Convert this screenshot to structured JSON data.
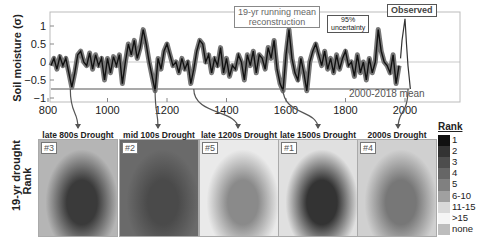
{
  "chart_data": [
    {
      "type": "line",
      "title": "",
      "xlabel": "",
      "ylabel": "Soil moisture (σ)",
      "xlim": [
        800,
        2018
      ],
      "ylim": [
        -1.1,
        1.4
      ],
      "x_ticks": [
        "800",
        "1000",
        "1200",
        "1400",
        "1600",
        "1800",
        "2000"
      ],
      "y_ticks": [
        "1",
        "0.5",
        "0",
        "-0.5",
        "-1"
      ],
      "grid": false,
      "series": [
        {
          "name": "19-yr running mean reconstruction",
          "x": [
            810,
            820,
            830,
            840,
            850,
            860,
            870,
            880,
            890,
            900,
            910,
            920,
            930,
            940,
            950,
            960,
            970,
            980,
            990,
            1000,
            1010,
            1020,
            1030,
            1040,
            1050,
            1060,
            1070,
            1080,
            1090,
            1100,
            1110,
            1120,
            1130,
            1140,
            1150,
            1160,
            1170,
            1180,
            1190,
            1200,
            1210,
            1220,
            1230,
            1240,
            1250,
            1260,
            1270,
            1280,
            1290,
            1300,
            1310,
            1320,
            1330,
            1340,
            1350,
            1360,
            1370,
            1380,
            1390,
            1400,
            1410,
            1420,
            1430,
            1440,
            1450,
            1460,
            1470,
            1480,
            1490,
            1500,
            1510,
            1520,
            1530,
            1540,
            1550,
            1560,
            1570,
            1580,
            1590,
            1600,
            1610,
            1620,
            1630,
            1640,
            1650,
            1660,
            1670,
            1680,
            1690,
            1700,
            1710,
            1720,
            1730,
            1740,
            1750,
            1760,
            1770,
            1780,
            1790,
            1800,
            1810,
            1820,
            1830,
            1840,
            1850,
            1860,
            1870,
            1880,
            1890,
            1900,
            1910,
            1920,
            1930,
            1940,
            1950,
            1960,
            1970,
            1980
          ],
          "values": [
            -0.1,
            0.1,
            -0.2,
            0.15,
            -0.1,
            0.1,
            -0.3,
            -0.7,
            -0.3,
            0.2,
            0.3,
            0.0,
            -0.1,
            0.25,
            -0.2,
            0.2,
            -0.1,
            0.1,
            -0.5,
            0.1,
            -0.3,
            0.15,
            -0.1,
            0.2,
            -0.6,
            0.0,
            0.5,
            0.2,
            0.6,
            0.1,
            0.4,
            0.9,
            0.5,
            0.0,
            -0.4,
            -0.8,
            0.1,
            -0.2,
            0.3,
            0.5,
            0.2,
            -0.1,
            0.0,
            -0.3,
            0.1,
            -0.2,
            0.0,
            -0.6,
            -0.2,
            0.3,
            0.6,
            0.5,
            0.0,
            0.2,
            -0.3,
            0.1,
            -0.1,
            0.4,
            -0.3,
            0.1,
            -0.4,
            -0.1,
            -0.2,
            0.2,
            0.0,
            -0.5,
            0.2,
            -0.1,
            0.3,
            -0.3,
            0.2,
            0.1,
            -0.2,
            0.4,
            0.1,
            0.6,
            -0.2,
            -0.6,
            -0.8,
            0.2,
            0.9,
            0.1,
            -0.3,
            -0.5,
            0.1,
            -0.3,
            -0.8,
            0.0,
            0.3,
            0.5,
            0.2,
            -0.1,
            0.3,
            -0.2,
            0.1,
            -0.3,
            0.2,
            -0.2,
            0.1,
            0.3,
            -0.1,
            0.0,
            -0.4,
            0.2,
            -0.3,
            0.0,
            -0.5,
            0.1,
            -0.3,
            0.0,
            0.9,
            0.3,
            0.0,
            -0.1,
            -0.3,
            0.2,
            -0.6,
            -0.1
          ]
        },
        {
          "name": "Observed",
          "x": [
            1985,
            1990,
            1995,
            2000,
            2005,
            2010,
            2015,
            2018
          ],
          "values": [
            0.1,
            0.6,
            0.9,
            1.2,
            0.5,
            -0.1,
            -0.5,
            -0.75
          ]
        },
        {
          "name": "2000-2018 mean",
          "x": [
            800,
            2018
          ],
          "values": [
            -0.75,
            -0.75
          ]
        }
      ],
      "annotations": [
        "19-yr running mean reconstruction",
        "95% uncertainty",
        "Observed",
        "2000-2018 mean"
      ]
    },
    {
      "type": "heatmap",
      "title": "19-yr drought Rank",
      "panels": [
        {
          "title": "late 800s Drought",
          "rank": "#3"
        },
        {
          "title": "mid 100s Drought",
          "rank": "#2"
        },
        {
          "title": "late 1200s Drought",
          "rank": "#5"
        },
        {
          "title": "late 1500s Drought",
          "rank": "#1"
        },
        {
          "title": "2000s Drought",
          "rank": "#4"
        }
      ],
      "legend": {
        "title": "Rank",
        "entries": [
          "1",
          "2",
          "3",
          "4",
          "5",
          "6-10",
          "11-15",
          ">15",
          "none"
        ]
      }
    }
  ],
  "labels": {
    "ylabel_top": "Soil moisture (σ)",
    "ylabel_bottom_1": "19-yr drought",
    "ylabel_bottom_2": "Rank",
    "ann_recon_1": "19-yr running mean",
    "ann_recon_2": "reconstruction",
    "ann_unc_1": "95%",
    "ann_unc_2": "uncertainty",
    "ann_obs": "Observed",
    "ann_mean": "2000-2018 mean",
    "legend_title": "Rank"
  }
}
